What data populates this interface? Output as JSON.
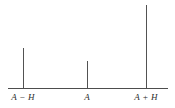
{
  "figure": {
    "background_color": "#ffffff",
    "line_color": "#525252",
    "axis_color": "#4d4d4d",
    "label_color": "#2b2b2b"
  },
  "axis": {
    "name": "horizontal-axis",
    "x_start_px": 8,
    "x_end_px": 168,
    "y_px": 88,
    "thickness_px": 1
  },
  "labels": [
    {
      "full": "A − H",
      "symbol": "A",
      "operator": "−",
      "offset": "H",
      "x_px": 23
    },
    {
      "full": "A",
      "symbol": "A",
      "operator": "",
      "offset": "",
      "x_px": 87
    },
    {
      "full": "A + H",
      "symbol": "A",
      "operator": "+",
      "offset": "H",
      "x_px": 146
    }
  ],
  "chart_data": {
    "type": "bar",
    "title": "",
    "subtitle": "",
    "xlabel": "",
    "ylabel": "",
    "categories": [
      "A − H",
      "A",
      "A + H"
    ],
    "values": [
      40,
      27,
      83
    ],
    "x_positions_px": [
      23,
      87,
      146
    ],
    "tops_px": [
      48,
      61,
      5
    ],
    "baseline_px": 88,
    "ylim": [
      0,
      90
    ],
    "xlim_px": [
      8,
      168
    ],
    "grid": false,
    "legend": null,
    "bar_width_px": 1,
    "annotations": []
  }
}
